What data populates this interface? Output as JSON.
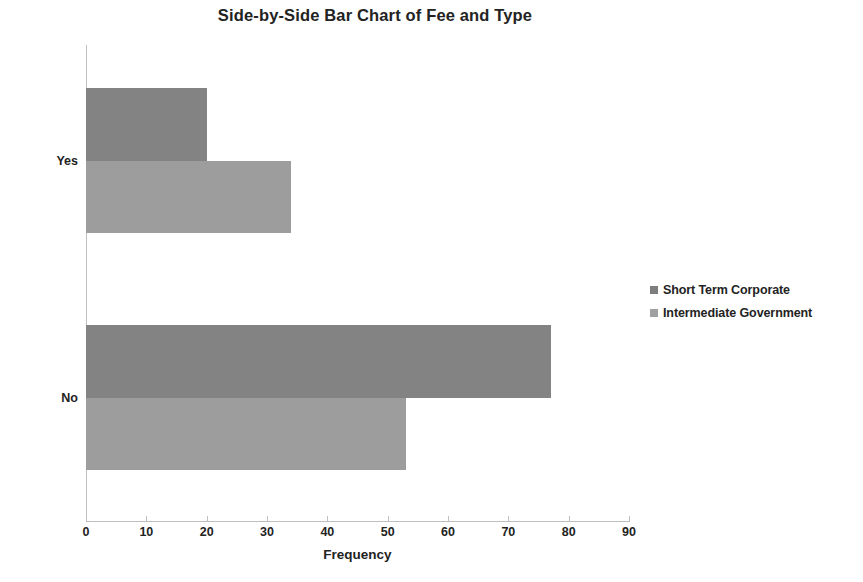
{
  "chart_data": {
    "type": "bar",
    "orientation": "horizontal",
    "title": "Side-by-Side Bar Chart of Fee and Type",
    "xlabel": "Frequency",
    "ylabel": "",
    "categories": [
      "Yes",
      "No"
    ],
    "series": [
      {
        "name": "Short Term Corporate",
        "values": [
          20,
          77
        ],
        "color": "#838383"
      },
      {
        "name": "Intermediate Government",
        "values": [
          34,
          53
        ],
        "color": "#9d9d9d"
      }
    ],
    "xlim": [
      0,
      90
    ],
    "xticks": [
      0,
      10,
      20,
      30,
      40,
      50,
      60,
      70,
      80,
      90
    ],
    "xtick_labels": [
      "0",
      "10",
      "20",
      "30",
      "40",
      "50",
      "60",
      "70",
      "80",
      "90"
    ],
    "grid": false,
    "legend_position": "right"
  }
}
